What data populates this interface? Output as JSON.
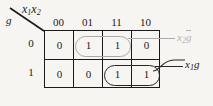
{
  "diagram": {
    "kind": "karnaugh-map",
    "header": {
      "column_vars": "x1x2",
      "column_vars_base": "x",
      "column_vars_sub1": "1",
      "column_vars_base2": "x",
      "column_vars_sub2": "2",
      "row_var": "g"
    },
    "column_headers": [
      "00",
      "01",
      "11",
      "10"
    ],
    "row_headers": [
      "0",
      "1"
    ],
    "rows": [
      {
        "label": "0",
        "cells": [
          "0",
          "1",
          "1",
          "0"
        ]
      },
      {
        "label": "1",
        "cells": [
          "0",
          "0",
          "1",
          "1"
        ]
      }
    ],
    "groups": [
      {
        "name": "group-x2-gbar",
        "label_base": "x",
        "label_sub": "2",
        "label_overbar": "g",
        "color": "#b4b4b4",
        "covers": "row0-col01-col11"
      },
      {
        "name": "group-x1-g",
        "label_base": "x",
        "label_sub": "1",
        "label_plain": "g",
        "color": "#1a1a1a",
        "covers": "row1-col11-col10"
      }
    ]
  }
}
